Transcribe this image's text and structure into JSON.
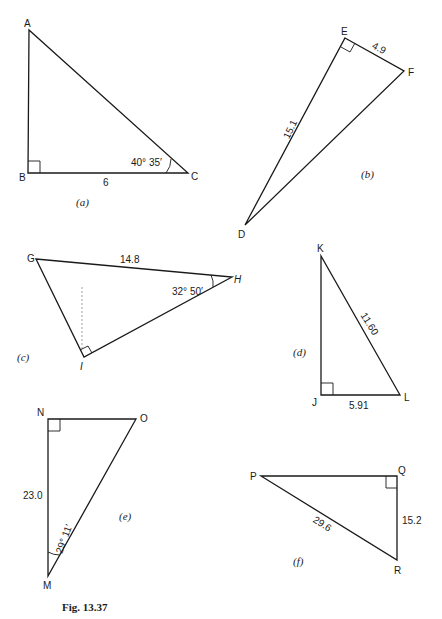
{
  "figure": {
    "caption": "Fig. 13.37",
    "triangles": [
      {
        "id": "a",
        "label": "(a)",
        "vertices": {
          "A": "A",
          "B": "B",
          "C": "C"
        },
        "right_angle_at": "B",
        "side_BC": "6",
        "angle_C": "40° 35′"
      },
      {
        "id": "b",
        "label": "(b)",
        "vertices": {
          "D": "D",
          "E": "E",
          "F": "F"
        },
        "right_angle_at": "E",
        "side_EF": "4.9",
        "side_DE": "15.1"
      },
      {
        "id": "c",
        "label": "(c)",
        "vertices": {
          "G": "G",
          "H": "H",
          "I": "I"
        },
        "right_angle_at": "I",
        "side_GH": "14.8",
        "angle_H": "32° 50′"
      },
      {
        "id": "d",
        "label": "(d)",
        "vertices": {
          "J": "J",
          "K": "K",
          "L": "L"
        },
        "right_angle_at": "J",
        "side_KL": "11.60",
        "side_JL": "5.91"
      },
      {
        "id": "e",
        "label": "(e)",
        "vertices": {
          "M": "M",
          "N": "N",
          "O": "O"
        },
        "right_angle_at": "N",
        "side_MN": "23.0",
        "angle_M": "29° 11′"
      },
      {
        "id": "f",
        "label": "(f)",
        "vertices": {
          "P": "P",
          "Q": "Q",
          "R": "R"
        },
        "right_angle_at": "Q",
        "side_PR": "29.6",
        "side_QR": "15.2"
      }
    ]
  }
}
